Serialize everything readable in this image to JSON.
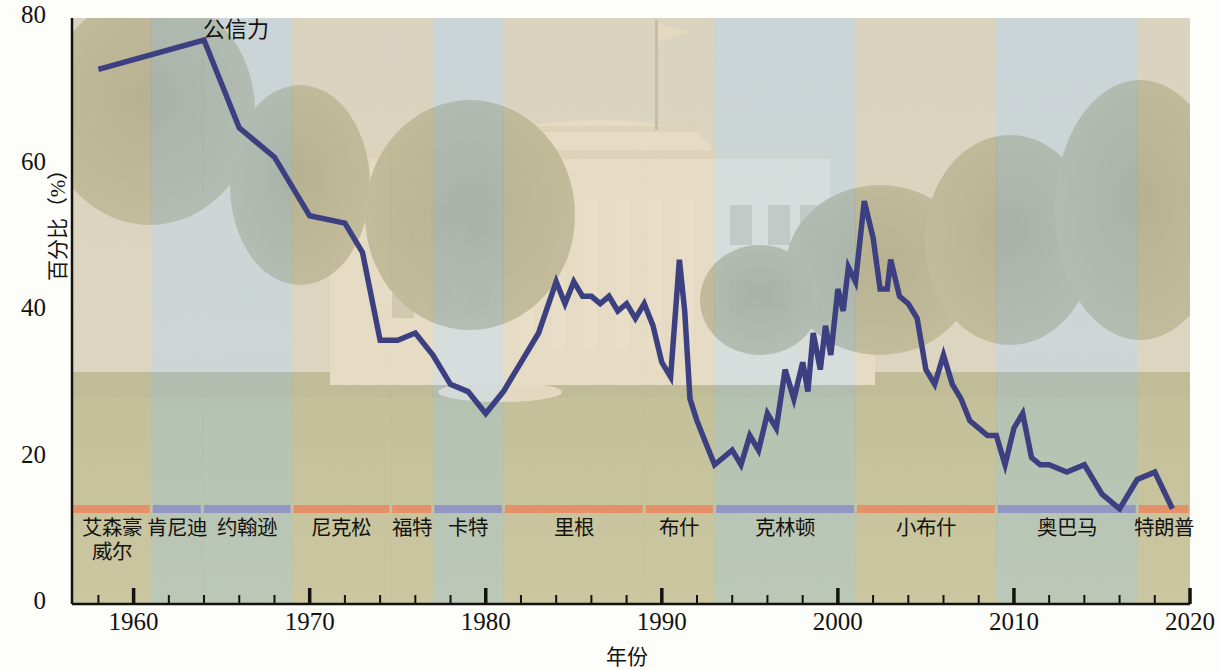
{
  "chart_data": {
    "type": "line",
    "title": "",
    "series_label": "公信力",
    "xlabel": "年份",
    "ylabel": "百分比（%）",
    "xlim": [
      1956.5,
      2020
    ],
    "ylim": [
      0,
      80
    ],
    "ytick_labels": [
      "0",
      "20",
      "40",
      "60",
      "80"
    ],
    "ytick_values": [
      0,
      20,
      40,
      60,
      80
    ],
    "xtick_labels": [
      "1960",
      "1970",
      "1980",
      "1990",
      "2000",
      "2010",
      "2020"
    ],
    "xtick_values": [
      1960,
      1970,
      1980,
      1990,
      2000,
      2010,
      2020
    ],
    "minor_tick_interval": 2,
    "grid": false,
    "legend_position": "none",
    "line_color": "#3c4080",
    "background_image": "white-house-south-lawn-photograph",
    "x": [
      1958,
      1964,
      1966,
      1968,
      1970,
      1972,
      1973,
      1974,
      1975,
      1976,
      1977,
      1978,
      1979,
      1980,
      1981,
      1982,
      1983,
      1984,
      1984.5,
      1985,
      1985.5,
      1986,
      1986.5,
      1987,
      1987.5,
      1988,
      1988.5,
      1989,
      1989.5,
      1990,
      1990.5,
      1991,
      1991.3,
      1991.6,
      1992,
      1992.5,
      1993,
      1993.5,
      1994,
      1994.5,
      1995,
      1995.5,
      1996,
      1996.5,
      1997,
      1997.5,
      1998,
      1998.3,
      1998.6,
      1999,
      1999.3,
      1999.6,
      2000,
      2000.3,
      2000.6,
      2001,
      2001.5,
      2002,
      2002.4,
      2002.8,
      2003,
      2003.5,
      2004,
      2004.5,
      2005,
      2005.5,
      2006,
      2006.5,
      2007,
      2007.5,
      2008,
      2008.5,
      2009,
      2009.5,
      2010,
      2010.5,
      2011,
      2011.5,
      2012,
      2013,
      2014,
      2015,
      2016,
      2017,
      2018,
      2019
    ],
    "y": [
      73,
      77,
      65,
      61,
      53,
      52,
      48,
      36,
      36,
      37,
      34,
      30,
      29,
      26,
      29,
      33,
      37,
      44,
      41,
      44,
      42,
      42,
      41,
      42,
      40,
      41,
      39,
      41,
      38,
      33,
      31,
      47,
      40,
      28,
      25,
      22,
      19,
      20,
      21,
      19,
      23,
      21,
      26,
      24,
      32,
      28,
      33,
      29,
      37,
      32,
      38,
      34,
      43,
      40,
      46,
      44,
      55,
      50,
      43,
      43,
      47,
      42,
      41,
      39,
      32,
      30,
      34,
      30,
      28,
      25,
      24,
      23,
      23,
      19,
      24,
      26,
      20,
      19,
      19,
      18,
      19,
      15,
      13,
      17,
      18,
      13
    ],
    "annotations": [
      {
        "text": "公信力",
        "x": 1966.5,
        "y": 79
      }
    ],
    "presidents": [
      {
        "label": "艾森豪\n威尔",
        "party_color": "#e88b63",
        "band_color": "#e0d0ae",
        "start": 1956.5,
        "end": 1961
      },
      {
        "label": "肯尼迪",
        "party_color": "#8e90c4",
        "band_color": "#c8d2d4",
        "start": 1961,
        "end": 1963.9
      },
      {
        "label": "约翰逊",
        "party_color": "#8e90c4",
        "band_color": "#c8d2d4",
        "start": 1963.9,
        "end": 1969
      },
      {
        "label": "尼克松",
        "party_color": "#e88b63",
        "band_color": "#e0d0ae",
        "start": 1969,
        "end": 1974.6
      },
      {
        "label": "福特",
        "party_color": "#e88b63",
        "band_color": "#e0d0ae",
        "start": 1974.6,
        "end": 1977
      },
      {
        "label": "卡特",
        "party_color": "#8e90c4",
        "band_color": "#c8d2d4",
        "start": 1977,
        "end": 1981
      },
      {
        "label": "里根",
        "party_color": "#e88b63",
        "band_color": "#e0d0ae",
        "start": 1981,
        "end": 1989
      },
      {
        "label": "布什",
        "party_color": "#e88b63",
        "band_color": "#e0d0ae",
        "start": 1989,
        "end": 1993
      },
      {
        "label": "克林顿",
        "party_color": "#8e90c4",
        "band_color": "#c8d2d4",
        "start": 1993,
        "end": 2001
      },
      {
        "label": "小布什",
        "party_color": "#e88b63",
        "band_color": "#e0d0ae",
        "start": 2001,
        "end": 2009
      },
      {
        "label": "奥巴马",
        "party_color": "#8e90c4",
        "band_color": "#c8d2d4",
        "start": 2009,
        "end": 2017
      },
      {
        "label": "特朗普",
        "party_color": "#e88b63",
        "band_color": "#e0d0ae",
        "start": 2017,
        "end": 2020
      }
    ]
  }
}
